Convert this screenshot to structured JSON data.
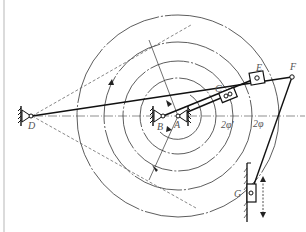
{
  "diagram": {
    "type": "mechanism-linkage",
    "labels": {
      "D": "D",
      "B": "B",
      "A": "A",
      "C": "C",
      "E": "E",
      "F": "F",
      "G": "G",
      "angle_inner": "2φ'",
      "angle_outer": "2φ"
    },
    "colors": {
      "line": "#222222",
      "thin": "#444444",
      "label": "#555555",
      "border": "#cccccc"
    },
    "points": {
      "D": [
        30,
        116
      ],
      "B": [
        163,
        116
      ],
      "A": [
        178,
        116
      ],
      "C": [
        228,
        95
      ],
      "E": [
        257,
        78
      ],
      "F": [
        292,
        77
      ],
      "G": [
        251,
        193
      ]
    },
    "circles_about_A": [
      101,
      74,
      55,
      38,
      24
    ]
  }
}
